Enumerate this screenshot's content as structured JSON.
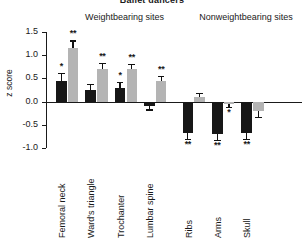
{
  "chart_data": {
    "type": "bar",
    "title": "Ballet dancers",
    "xlabel": "",
    "ylabel": "z score",
    "ylim": [
      -1.0,
      1.5
    ],
    "yticks": [
      "1.5",
      "1.0",
      "0.5",
      "0.0",
      "-0.5",
      "-1.0"
    ],
    "ytick_values": [
      1.5,
      1.0,
      0.5,
      0.0,
      -0.5,
      -1.0
    ],
    "grid": false,
    "legend": "none",
    "group_headers": [
      {
        "label": "Weightbearing sites",
        "categories": [
          "Femoral neck",
          "Ward's triangle",
          "Trochanter",
          "Lumbar spine"
        ]
      },
      {
        "label": "Nonweightbearing sites",
        "categories": [
          "Ribs",
          "Arms",
          "Skull"
        ]
      }
    ],
    "categories": [
      "Femoral neck",
      "Ward's triangle",
      "Trochanter",
      "Lumbar spine",
      "Ribs",
      "Arms",
      "Skull"
    ],
    "series": [
      {
        "name": "black",
        "color": "#171717",
        "values": [
          0.45,
          0.25,
          0.3,
          -0.1,
          -0.68,
          -0.7,
          -0.68
        ],
        "errors": [
          0.17,
          0.14,
          0.12,
          0.07,
          0.13,
          0.13,
          0.12
        ],
        "significance": [
          "*",
          "",
          "*",
          "",
          "**",
          "**",
          "**"
        ]
      },
      {
        "name": "gray",
        "color": "#b4b4b4",
        "values": [
          1.15,
          0.7,
          0.7,
          0.45,
          0.09,
          -0.05,
          -0.2
        ],
        "errors": [
          0.17,
          0.13,
          0.12,
          0.1,
          0.09,
          0.06,
          0.13
        ],
        "significance": [
          "**",
          "**",
          "**",
          "**",
          "",
          "*",
          ""
        ]
      }
    ]
  }
}
